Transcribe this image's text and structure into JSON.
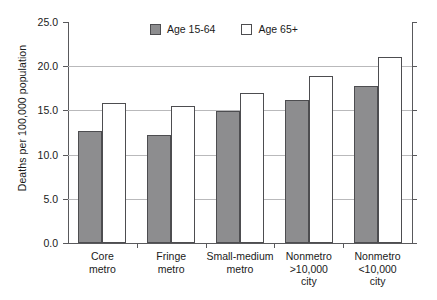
{
  "chart_data": {
    "type": "bar",
    "title": "",
    "subtitle": "",
    "xlabel": "",
    "ylabel": "Deaths per 100,000 population",
    "categories": [
      "Core metro",
      "Fringe metro",
      "Small-medium metro",
      "Nonmetro >10,000 city",
      "Nonmetro <10,000 city"
    ],
    "category_lines": [
      [
        "Core",
        "metro"
      ],
      [
        "Fringe",
        "metro"
      ],
      [
        "Small-medium",
        "metro"
      ],
      [
        "Nonmetro",
        ">10,000",
        "city"
      ],
      [
        "Nonmetro",
        "<10,000",
        "city"
      ]
    ],
    "series": [
      {
        "name": "Age 15-64",
        "color": "#8d8d8f",
        "values": [
          12.7,
          12.2,
          14.9,
          16.2,
          17.8
        ]
      },
      {
        "name": "Age 65+",
        "color": "#ffffff",
        "values": [
          15.8,
          15.5,
          17.0,
          18.9,
          21.0
        ]
      }
    ],
    "ylim": [
      0.0,
      25.0
    ],
    "ytick_step": 5.0,
    "yticks": [
      0.0,
      5.0,
      10.0,
      15.0,
      20.0,
      25.0
    ],
    "ytick_labels": [
      "0.0",
      "5.0",
      "10.0",
      "15.0",
      "20.0",
      "25.0"
    ],
    "grid": true,
    "grid_axis": "y",
    "legend_position": "top-center"
  },
  "legend": {
    "items": [
      {
        "label": "Age 15-64"
      },
      {
        "label": "Age 65+"
      }
    ]
  },
  "caption": {
    "cropped_text": ""
  }
}
